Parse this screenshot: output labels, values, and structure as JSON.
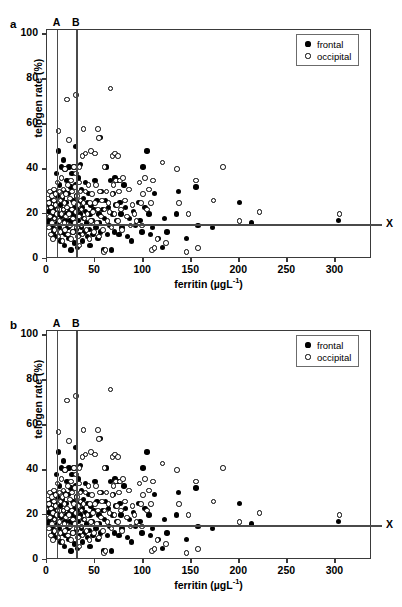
{
  "figure": {
    "panels": [
      {
        "letter": "a"
      },
      {
        "letter": "b"
      }
    ],
    "axes": {
      "xlabel_main": "ferritin (µgL",
      "xlabel_sup": "-1",
      "xlabel_close": ")",
      "xlabel_full": "ferritin (µgL-1)",
      "ylabel": "telogen rate (%)",
      "xticks": [
        0,
        50,
        100,
        150,
        200,
        250,
        300
      ],
      "yticks": [
        0,
        20,
        40,
        60,
        80,
        100
      ],
      "xlim": [
        0,
        338
      ],
      "ylim": [
        0,
        102
      ]
    },
    "legend": {
      "entries": [
        {
          "label": "frontal",
          "marker": "filled-circle",
          "color": "#000000"
        },
        {
          "label": "occipital",
          "marker": "open-circle",
          "color": "#ffffff"
        }
      ]
    },
    "reference_lines": {
      "vertical": [
        {
          "label": "A",
          "x": 10
        },
        {
          "label": "B",
          "x": 30
        }
      ],
      "horizontal": [
        {
          "label": "X",
          "y": 15
        }
      ]
    },
    "colors": {
      "frame": "#3a3a3a",
      "reference_line": "#4a4a4a",
      "frontal": "#000000",
      "occipital": "#ffffff",
      "background": "#ffffff"
    }
  },
  "chart_data": {
    "type": "scatter",
    "title": "",
    "xlabel": "ferritin (µgL-1)",
    "ylabel": "telogen rate (%)",
    "xlim": [
      0,
      338
    ],
    "ylim": [
      0,
      102
    ],
    "grid": false,
    "legend_position": "top-right",
    "annotations": [
      {
        "text": "A",
        "type": "vline",
        "x": 10
      },
      {
        "text": "B",
        "type": "vline",
        "x": 30
      },
      {
        "text": "X",
        "type": "hline",
        "y": 15
      },
      {
        "text": "a",
        "type": "panel-label"
      },
      {
        "text": "b",
        "type": "panel-label"
      }
    ],
    "note": "Panels a and b show the same scatter distribution of telogen rate versus serum ferritin; filled = frontal scalp, open = occipital scalp.",
    "series": [
      {
        "name": "frontal",
        "marker": "filled-circle",
        "points": [
          [
            2,
            21
          ],
          [
            2,
            17
          ],
          [
            3,
            24
          ],
          [
            3,
            16
          ],
          [
            4,
            22
          ],
          [
            5,
            19
          ],
          [
            5,
            26
          ],
          [
            6,
            14
          ],
          [
            6,
            23
          ],
          [
            7,
            20
          ],
          [
            7,
            12
          ],
          [
            8,
            30
          ],
          [
            8,
            18
          ],
          [
            9,
            25
          ],
          [
            9,
            10
          ],
          [
            10,
            38
          ],
          [
            10,
            22
          ],
          [
            11,
            16
          ],
          [
            11,
            28
          ],
          [
            12,
            48
          ],
          [
            12,
            20
          ],
          [
            13,
            14
          ],
          [
            13,
            33
          ],
          [
            14,
            24
          ],
          [
            14,
            8
          ],
          [
            15,
            41
          ],
          [
            15,
            19
          ],
          [
            16,
            27
          ],
          [
            16,
            12
          ],
          [
            17,
            44
          ],
          [
            17,
            22
          ],
          [
            18,
            30
          ],
          [
            18,
            6
          ],
          [
            19,
            40
          ],
          [
            19,
            17
          ],
          [
            20,
            25
          ],
          [
            20,
            11
          ],
          [
            21,
            35
          ],
          [
            21,
            20
          ],
          [
            22,
            14
          ],
          [
            22,
            29
          ],
          [
            23,
            41
          ],
          [
            23,
            9
          ],
          [
            24,
            22
          ],
          [
            24,
            17
          ],
          [
            25,
            32
          ],
          [
            25,
            4
          ],
          [
            26,
            38
          ],
          [
            26,
            20
          ],
          [
            27,
            12
          ],
          [
            27,
            26
          ],
          [
            28,
            41
          ],
          [
            28,
            16
          ],
          [
            29,
            7
          ],
          [
            29,
            23
          ],
          [
            30,
            50
          ],
          [
            30,
            33
          ],
          [
            30,
            19
          ],
          [
            31,
            13
          ],
          [
            31,
            28
          ],
          [
            32,
            22
          ],
          [
            32,
            5
          ],
          [
            33,
            36
          ],
          [
            33,
            17
          ],
          [
            34,
            11
          ],
          [
            34,
            25
          ],
          [
            35,
            42
          ],
          [
            35,
            20
          ],
          [
            36,
            14
          ],
          [
            36,
            31
          ],
          [
            37,
            8
          ],
          [
            37,
            23
          ],
          [
            38,
            18
          ],
          [
            38,
            27
          ],
          [
            39,
            12
          ],
          [
            40,
            21
          ],
          [
            40,
            34
          ],
          [
            41,
            16
          ],
          [
            42,
            10
          ],
          [
            42,
            25
          ],
          [
            43,
            29
          ],
          [
            44,
            13
          ],
          [
            45,
            20
          ],
          [
            45,
            6
          ],
          [
            46,
            24
          ],
          [
            47,
            17
          ],
          [
            48,
            11
          ],
          [
            49,
            22
          ],
          [
            50,
            35
          ],
          [
            51,
            14
          ],
          [
            52,
            26
          ],
          [
            53,
            9
          ],
          [
            54,
            20
          ],
          [
            55,
            16
          ],
          [
            56,
            54
          ],
          [
            56,
            12
          ],
          [
            57,
            30
          ],
          [
            58,
            22
          ],
          [
            59,
            4
          ],
          [
            60,
            18
          ],
          [
            61,
            26
          ],
          [
            62,
            41
          ],
          [
            63,
            11
          ],
          [
            64,
            23
          ],
          [
            65,
            15
          ],
          [
            66,
            35
          ],
          [
            67,
            4
          ],
          [
            68,
            20
          ],
          [
            69,
            29
          ],
          [
            70,
            12
          ],
          [
            71,
            36
          ],
          [
            72,
            24
          ],
          [
            73,
            17
          ],
          [
            74,
            35
          ],
          [
            75,
            11
          ],
          [
            76,
            25
          ],
          [
            77,
            20
          ],
          [
            78,
            14
          ],
          [
            80,
            33
          ],
          [
            82,
            23
          ],
          [
            84,
            10
          ],
          [
            86,
            18
          ],
          [
            88,
            8
          ],
          [
            90,
            21
          ],
          [
            92,
            15
          ],
          [
            95,
            25
          ],
          [
            97,
            17
          ],
          [
            99,
            12
          ],
          [
            100,
            41
          ],
          [
            102,
            23
          ],
          [
            104,
            48
          ],
          [
            106,
            20
          ],
          [
            108,
            11
          ],
          [
            110,
            14
          ],
          [
            112,
            29
          ],
          [
            116,
            9
          ],
          [
            120,
            5
          ],
          [
            122,
            18
          ],
          [
            125,
            12
          ],
          [
            135,
            20
          ],
          [
            137,
            30
          ],
          [
            145,
            9
          ],
          [
            155,
            32
          ],
          [
            157,
            15
          ],
          [
            172,
            14
          ],
          [
            200,
            25
          ],
          [
            213,
            16
          ],
          [
            303,
            17
          ]
        ]
      },
      {
        "name": "occipital",
        "marker": "open-circle",
        "points": [
          [
            1,
            27
          ],
          [
            2,
            25
          ],
          [
            2,
            14
          ],
          [
            3,
            19
          ],
          [
            3,
            30
          ],
          [
            4,
            11
          ],
          [
            4,
            23
          ],
          [
            5,
            28
          ],
          [
            5,
            16
          ],
          [
            6,
            21
          ],
          [
            6,
            9
          ],
          [
            7,
            26
          ],
          [
            7,
            31
          ],
          [
            8,
            18
          ],
          [
            8,
            13
          ],
          [
            9,
            24
          ],
          [
            9,
            29
          ],
          [
            10,
            20
          ],
          [
            10,
            15
          ],
          [
            11,
            34
          ],
          [
            11,
            22
          ],
          [
            12,
            57
          ],
          [
            12,
            10
          ],
          [
            13,
            30
          ],
          [
            13,
            17
          ],
          [
            14,
            26
          ],
          [
            14,
            12
          ],
          [
            15,
            36
          ],
          [
            15,
            20
          ],
          [
            16,
            28
          ],
          [
            16,
            8
          ],
          [
            17,
            22
          ],
          [
            17,
            31
          ],
          [
            18,
            16
          ],
          [
            18,
            25
          ],
          [
            19,
            40
          ],
          [
            19,
            13
          ],
          [
            20,
            29
          ],
          [
            20,
            19
          ],
          [
            21,
            71
          ],
          [
            21,
            23
          ],
          [
            22,
            11
          ],
          [
            22,
            33
          ],
          [
            23,
            53
          ],
          [
            23,
            20
          ],
          [
            24,
            15
          ],
          [
            24,
            27
          ],
          [
            25,
            35
          ],
          [
            25,
            9
          ],
          [
            26,
            22
          ],
          [
            26,
            30
          ],
          [
            27,
            18
          ],
          [
            27,
            12
          ],
          [
            28,
            41
          ],
          [
            28,
            25
          ],
          [
            29,
            32
          ],
          [
            29,
            16
          ],
          [
            30,
            73
          ],
          [
            30,
            21
          ],
          [
            30,
            38
          ],
          [
            31,
            14
          ],
          [
            31,
            28
          ],
          [
            32,
            24
          ],
          [
            32,
            10
          ],
          [
            33,
            34
          ],
          [
            33,
            19
          ],
          [
            34,
            41
          ],
          [
            34,
            6
          ],
          [
            35,
            26
          ],
          [
            35,
            30
          ],
          [
            36,
            15
          ],
          [
            36,
            22
          ],
          [
            37,
            46
          ],
          [
            37,
            11
          ],
          [
            38,
            58
          ],
          [
            38,
            25
          ],
          [
            39,
            18
          ],
          [
            40,
            47
          ],
          [
            40,
            30
          ],
          [
            41,
            13
          ],
          [
            42,
            20
          ],
          [
            43,
            33
          ],
          [
            44,
            9
          ],
          [
            45,
            25
          ],
          [
            46,
            48
          ],
          [
            46,
            17
          ],
          [
            47,
            29
          ],
          [
            48,
            21
          ],
          [
            49,
            12
          ],
          [
            50,
            47
          ],
          [
            50,
            25
          ],
          [
            51,
            33
          ],
          [
            52,
            16
          ],
          [
            53,
            58
          ],
          [
            53,
            22
          ],
          [
            54,
            54
          ],
          [
            54,
            10
          ],
          [
            55,
            30
          ],
          [
            56,
            19
          ],
          [
            57,
            26
          ],
          [
            58,
            13
          ],
          [
            59,
            3
          ],
          [
            60,
            41
          ],
          [
            60,
            22
          ],
          [
            61,
            4
          ],
          [
            62,
            30
          ],
          [
            63,
            17
          ],
          [
            64,
            25
          ],
          [
            65,
            21
          ],
          [
            66,
            76
          ],
          [
            67,
            14
          ],
          [
            68,
            46
          ],
          [
            68,
            29
          ],
          [
            69,
            33
          ],
          [
            70,
            20
          ],
          [
            71,
            47
          ],
          [
            72,
            35
          ],
          [
            73,
            24
          ],
          [
            74,
            46
          ],
          [
            74,
            17
          ],
          [
            75,
            30
          ],
          [
            76,
            35
          ],
          [
            77,
            22
          ],
          [
            78,
            13
          ],
          [
            79,
            36
          ],
          [
            81,
            26
          ],
          [
            83,
            19
          ],
          [
            85,
            31
          ],
          [
            87,
            15
          ],
          [
            89,
            24
          ],
          [
            91,
            20
          ],
          [
            93,
            17
          ],
          [
            96,
            34
          ],
          [
            98,
            25
          ],
          [
            99,
            15
          ],
          [
            100,
            29
          ],
          [
            102,
            36
          ],
          [
            104,
            22
          ],
          [
            106,
            31
          ],
          [
            108,
            25
          ],
          [
            109,
            4
          ],
          [
            110,
            35
          ],
          [
            112,
            5
          ],
          [
            115,
            9
          ],
          [
            120,
            43
          ],
          [
            124,
            7
          ],
          [
            135,
            40
          ],
          [
            137,
            25
          ],
          [
            145,
            3
          ],
          [
            147,
            20
          ],
          [
            157,
            5
          ],
          [
            155,
            35
          ],
          [
            183,
            41
          ],
          [
            173,
            26
          ],
          [
            200,
            17
          ],
          [
            221,
            21
          ],
          [
            304,
            20
          ]
        ]
      }
    ]
  }
}
